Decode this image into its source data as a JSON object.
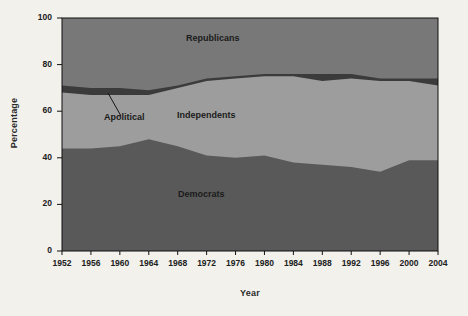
{
  "figure": {
    "background_color": "#f2f1ec",
    "plot": {
      "left": 62,
      "right": 438,
      "top": 18,
      "bottom": 251
    }
  },
  "axes": {
    "ylabel": "Percentage",
    "xlabel": "Year",
    "yticks": [
      0,
      20,
      40,
      60,
      80,
      100
    ],
    "ytick_labels": [
      "0",
      "20",
      "40",
      "60",
      "80",
      "100"
    ],
    "xtick_labels": [
      "1952",
      "1956",
      "1960",
      "1964",
      "1968",
      "1972",
      "1976",
      "1980",
      "1984",
      "1988",
      "1992",
      "1996",
      "2000",
      "2004"
    ],
    "ylim": [
      0,
      100
    ],
    "axis_color": "#111111"
  },
  "labels": {
    "republicans": "Republicans",
    "independents": "Independents",
    "democrats": "Democrats",
    "apolitical": "Apolitical"
  },
  "colors": {
    "democrats": "#595959",
    "independents": "#9d9d9d",
    "apolitical": "#3b3b3b",
    "republicans": "#787878",
    "background": "#f2f1ec",
    "text": "#1b1b1b"
  },
  "chart_data": {
    "type": "area",
    "title": "",
    "xlabel": "Year",
    "ylabel": "Percentage",
    "ylim": [
      0,
      100
    ],
    "grid": false,
    "legend": "inline-labels",
    "stacked": true,
    "stack_order": [
      "Democrats",
      "Independents",
      "Apolitical",
      "Republicans"
    ],
    "categories": [
      1952,
      1956,
      1960,
      1964,
      1968,
      1972,
      1976,
      1980,
      1984,
      1988,
      1992,
      1996,
      2000,
      2004
    ],
    "series": [
      {
        "name": "Democrats",
        "values": [
          44,
          44,
          45,
          48,
          45,
          41,
          40,
          41,
          38,
          37,
          36,
          34,
          39,
          39
        ]
      },
      {
        "name": "Independents",
        "values": [
          24,
          23,
          22,
          19,
          25,
          32,
          34,
          34,
          37,
          36,
          38,
          39,
          34,
          32
        ]
      },
      {
        "name": "Apolitical",
        "values": [
          3,
          3,
          3,
          2,
          1,
          1,
          1,
          1,
          1,
          3,
          2,
          1,
          1,
          3
        ]
      },
      {
        "name": "Republicans",
        "values": [
          29,
          30,
          30,
          31,
          29,
          26,
          25,
          24,
          24,
          24,
          24,
          26,
          26,
          26
        ]
      }
    ],
    "cumulative_tops": {
      "democrats_top": [
        44,
        44,
        45,
        48,
        45,
        41,
        40,
        41,
        38,
        37,
        36,
        34,
        39,
        39
      ],
      "independents_top": [
        68,
        67,
        67,
        67,
        70,
        73,
        74,
        75,
        75,
        73,
        74,
        73,
        73,
        71
      ],
      "apolitical_top": [
        71,
        70,
        70,
        69,
        71,
        74,
        75,
        76,
        76,
        76,
        76,
        74,
        74,
        74
      ]
    }
  }
}
